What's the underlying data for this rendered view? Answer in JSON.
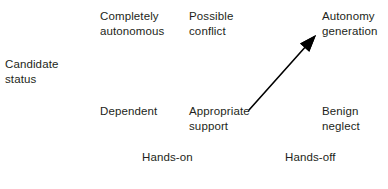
{
  "diagram": {
    "type": "two-by-three-matrix",
    "background_color": "#ffffff",
    "text_color": "#231f20",
    "vertical_axis": {
      "label": "Candidate\nstatus"
    },
    "horizontal_axis": {
      "ticks": [
        {
          "label": "Hands-on"
        },
        {
          "label": "Hands-off"
        }
      ]
    },
    "cells": [
      {
        "id": "completely-autonomous",
        "label": "Completely\nautonomous",
        "row": "top",
        "column": "left"
      },
      {
        "id": "possible-conflict",
        "label": "Possible\nconflict",
        "row": "top",
        "column": "middle"
      },
      {
        "id": "autonomy-generation",
        "label": "Autonomy\ngeneration",
        "row": "top",
        "column": "right"
      },
      {
        "id": "dependent",
        "label": "Dependent",
        "row": "bottom",
        "column": "left"
      },
      {
        "id": "appropriate-support",
        "label": "Appropriate\nsupport",
        "row": "bottom",
        "column": "middle"
      },
      {
        "id": "benign-neglect",
        "label": "Benign\nneglect",
        "row": "bottom",
        "column": "right"
      }
    ],
    "arrow": {
      "from_cell": "appropriate-support",
      "to_cell": "autonomy-generation",
      "color": "#000000",
      "start_x": 249,
      "start_y": 110,
      "end_x": 316,
      "end_y": 35
    }
  }
}
